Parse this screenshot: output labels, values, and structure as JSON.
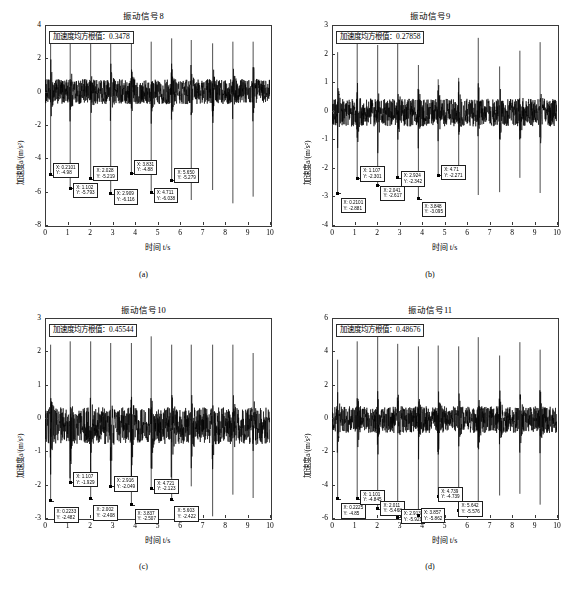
{
  "figure": {
    "axis_color": "#3a3a3a",
    "signal_color": "#000000",
    "xlabel": "时间 t/s",
    "ylabel": "加速度a/(m/s²)",
    "rms_prefix": "加速度均方根值："
  },
  "chart_data": [
    {
      "id": "panel-a",
      "type": "line",
      "title": "振动信号9",
      "title_actual": "振动信号8",
      "caption": "(a)",
      "xlabel": "时间 t/s",
      "ylabel": "加速度a/(m/s²)",
      "rms_label": "加速度均方根值：0.3478",
      "rms_value": "0.3478",
      "xlim": [
        0,
        10
      ],
      "ylim": [
        -8,
        4
      ],
      "xticks": [
        "0",
        "1",
        "2",
        "3",
        "4",
        "5",
        "6",
        "7",
        "8",
        "9",
        "10"
      ],
      "yticks": [
        "4",
        "2",
        "0",
        "-2",
        "-4",
        "-6",
        "-8"
      ],
      "grid": false,
      "noise_band": [
        -0.75,
        0.75
      ],
      "positive_spikes": [
        {
          "x": 0.25,
          "y": 3.3
        },
        {
          "x": 1.12,
          "y": 3.2
        },
        {
          "x": 2.03,
          "y": 3.1
        },
        {
          "x": 2.92,
          "y": 3.2
        },
        {
          "x": 3.84,
          "y": 3.1
        },
        {
          "x": 4.72,
          "y": 3.0
        },
        {
          "x": 5.63,
          "y": 3.2
        },
        {
          "x": 6.5,
          "y": 3.1
        },
        {
          "x": 7.45,
          "y": 2.9
        },
        {
          "x": 8.35,
          "y": 3.0
        },
        {
          "x": 9.25,
          "y": 3.0
        }
      ],
      "negative_spikes": [
        {
          "x": 0.25,
          "y": -4.98
        },
        {
          "x": 1.12,
          "y": -5.79
        },
        {
          "x": 2.03,
          "y": -5.23
        },
        {
          "x": 2.92,
          "y": -6.12
        },
        {
          "x": 3.84,
          "y": -4.88
        },
        {
          "x": 4.72,
          "y": -6.05
        },
        {
          "x": 5.63,
          "y": -5.3
        },
        {
          "x": 6.5,
          "y": -6.5
        },
        {
          "x": 7.45,
          "y": -5.9
        },
        {
          "x": 8.35,
          "y": -6.7
        },
        {
          "x": 9.25,
          "y": -6.3
        }
      ],
      "datatips": [
        {
          "x": "X: 0.2101",
          "y": "Y: -4.98",
          "px": 0.25,
          "py": -4.98,
          "bx": 0.35,
          "by": -4.25
        },
        {
          "x": "X: 1.102",
          "y": "Y: -5.793",
          "px": 1.12,
          "py": -5.79,
          "bx": 1.25,
          "by": -5.45
        },
        {
          "x": "X: 2.028",
          "y": "Y: -5.219",
          "px": 2.03,
          "py": -5.23,
          "bx": 2.15,
          "by": -4.45
        },
        {
          "x": "X: 2.909",
          "y": "Y: -6.116",
          "px": 2.92,
          "py": -6.12,
          "bx": 3.05,
          "by": -5.85
        },
        {
          "x": "X: 3.831",
          "y": "Y: -4.88",
          "px": 3.84,
          "py": -4.88,
          "bx": 3.95,
          "by": -4.08
        },
        {
          "x": "X: 4.711",
          "y": "Y: -6.038",
          "px": 4.72,
          "py": -6.05,
          "bx": 4.83,
          "by": -5.78
        },
        {
          "x": "X: 5.650",
          "y": "Y: -5.279",
          "px": 5.63,
          "py": -5.3,
          "bx": 5.75,
          "by": -4.55
        }
      ]
    },
    {
      "id": "panel-b",
      "type": "line",
      "title": "振动信号9",
      "caption": "(b)",
      "xlabel": "时间 t/s",
      "ylabel": "加速度a/(m/s²)",
      "rms_label": "加速度均方根值：0.27858",
      "rms_value": "0.27858",
      "xlim": [
        0,
        10
      ],
      "ylim": [
        -4,
        3
      ],
      "xticks": [
        "0",
        "1",
        "2",
        "3",
        "4",
        "5",
        "6",
        "7",
        "8",
        "9",
        "10"
      ],
      "yticks": [
        "3",
        "2",
        "1",
        "0",
        "-1",
        "-2",
        "-3",
        "-4"
      ],
      "grid": false,
      "noise_band": [
        -0.55,
        0.42
      ],
      "positive_spikes": [
        {
          "x": 0.25,
          "y": 2.05
        },
        {
          "x": 1.12,
          "y": 2.35
        },
        {
          "x": 2.03,
          "y": 2.3
        },
        {
          "x": 2.92,
          "y": 2.35
        },
        {
          "x": 3.84,
          "y": 1.6
        },
        {
          "x": 4.72,
          "y": 1.1
        },
        {
          "x": 5.63,
          "y": 1.15
        },
        {
          "x": 6.5,
          "y": 2.55
        },
        {
          "x": 7.45,
          "y": 1.55
        },
        {
          "x": 8.35,
          "y": 2.1
        },
        {
          "x": 9.25,
          "y": 2.4
        }
      ],
      "negative_spikes": [
        {
          "x": 0.25,
          "y": -2.88
        },
        {
          "x": 1.12,
          "y": -2.37
        },
        {
          "x": 2.03,
          "y": -2.6
        },
        {
          "x": 2.92,
          "y": -2.34
        },
        {
          "x": 3.84,
          "y": -3.08
        },
        {
          "x": 4.72,
          "y": -2.25
        },
        {
          "x": 5.63,
          "y": -2.18
        },
        {
          "x": 6.5,
          "y": -2.95
        },
        {
          "x": 7.45,
          "y": -2.85
        },
        {
          "x": 8.35,
          "y": -2.35
        },
        {
          "x": 9.25,
          "y": -2.88
        }
      ],
      "datatips": [
        {
          "x": "X: 0.2101",
          "y": "Y: -2.881",
          "px": 0.25,
          "py": -2.88,
          "bx": 0.38,
          "by": -3.05
        },
        {
          "x": "X: 1.107",
          "y": "Y: -2.301",
          "px": 1.12,
          "py": -2.37,
          "bx": 1.25,
          "by": -1.95
        },
        {
          "x": "X: 2.041",
          "y": "Y: -2.617",
          "px": 2.03,
          "py": -2.6,
          "bx": 2.15,
          "by": -2.62
        },
        {
          "x": "X: 2.924",
          "y": "Y: -2.342",
          "px": 2.92,
          "py": -2.34,
          "bx": 3.05,
          "by": -2.12
        },
        {
          "x": "X: 3.848",
          "y": "Y: -3.095",
          "px": 3.84,
          "py": -3.08,
          "bx": 3.98,
          "by": -3.18
        },
        {
          "x": "X: 4.71",
          "y": "Y: -2.271",
          "px": 4.72,
          "py": -2.25,
          "bx": 4.85,
          "by": -1.9
        }
      ]
    },
    {
      "id": "panel-c",
      "type": "line",
      "title": "振动信号10",
      "caption": "(c)",
      "xlabel": "时间 t/s",
      "ylabel": "加速度a/(m/s²)",
      "rms_label": "加速度均方根值：0.45544",
      "rms_value": "0.45544",
      "xlim": [
        0,
        10
      ],
      "ylim": [
        -3,
        3
      ],
      "xticks": [
        "0",
        "1",
        "2",
        "3",
        "4",
        "5",
        "6",
        "7",
        "8",
        "9",
        "10"
      ],
      "yticks": [
        "3",
        "2",
        "1",
        "0",
        "-1",
        "-2",
        "-3"
      ],
      "grid": false,
      "noise_band": [
        -0.78,
        0.32
      ],
      "positive_spikes": [
        {
          "x": 0.25,
          "y": 2.2
        },
        {
          "x": 1.12,
          "y": 2.3
        },
        {
          "x": 2.03,
          "y": 2.3
        },
        {
          "x": 2.92,
          "y": 2.25
        },
        {
          "x": 3.84,
          "y": 2.25
        },
        {
          "x": 4.72,
          "y": 2.45
        },
        {
          "x": 5.63,
          "y": 2.2
        },
        {
          "x": 6.5,
          "y": 2.2
        },
        {
          "x": 7.45,
          "y": 2.2
        },
        {
          "x": 8.35,
          "y": 2.2
        },
        {
          "x": 9.25,
          "y": 1.95
        }
      ],
      "negative_spikes": [
        {
          "x": 0.25,
          "y": -2.48
        },
        {
          "x": 1.12,
          "y": -1.93
        },
        {
          "x": 2.03,
          "y": -2.42
        },
        {
          "x": 2.92,
          "y": -2.05
        },
        {
          "x": 3.84,
          "y": -2.6
        },
        {
          "x": 4.72,
          "y": -2.12
        },
        {
          "x": 5.63,
          "y": -2.45
        },
        {
          "x": 6.5,
          "y": -2.05
        },
        {
          "x": 7.45,
          "y": -2.95
        },
        {
          "x": 8.35,
          "y": -2.3
        },
        {
          "x": 9.25,
          "y": -2.4
        }
      ],
      "datatips": [
        {
          "x": "X: 0.2233",
          "y": "Y: -2.482",
          "px": 0.25,
          "py": -2.48,
          "bx": 0.38,
          "by": -2.68
        },
        {
          "x": "X: 1.107",
          "y": "Y: -1.929",
          "px": 1.12,
          "py": -1.93,
          "bx": 1.25,
          "by": -1.62
        },
        {
          "x": "X: 2.002",
          "y": "Y: -2.408",
          "px": 2.03,
          "py": -2.42,
          "bx": 2.15,
          "by": -2.62
        },
        {
          "x": "X: 2.916",
          "y": "Y: -2.049",
          "px": 2.92,
          "py": -2.05,
          "bx": 3.05,
          "by": -1.75
        },
        {
          "x": "X: 3.837",
          "y": "Y: -2.507",
          "px": 3.84,
          "py": -2.6,
          "bx": 3.98,
          "by": -2.72
        },
        {
          "x": "X: 4.721",
          "y": "Y: -2.123",
          "px": 4.72,
          "py": -2.12,
          "bx": 4.85,
          "by": -1.82
        },
        {
          "x": "X: 5.603",
          "y": "Y: -2.422",
          "px": 5.63,
          "py": -2.45,
          "bx": 5.75,
          "by": -2.65
        }
      ]
    },
    {
      "id": "panel-d",
      "type": "line",
      "title": "振动信号11",
      "caption": "(d)",
      "xlabel": "时间 t/s",
      "ylabel": "加速度a/(m/s²)",
      "rms_label": "加速度均方根值：0.48676",
      "rms_value": "0.48676",
      "xlim": [
        0,
        10
      ],
      "ylim": [
        -6,
        6
      ],
      "xticks": [
        "0",
        "1",
        "2",
        "3",
        "4",
        "5",
        "6",
        "7",
        "8",
        "9",
        "10"
      ],
      "yticks": [
        "6",
        "4",
        "2",
        "0",
        "-2",
        "-4",
        "-6"
      ],
      "grid": false,
      "noise_band": [
        -0.9,
        0.7
      ],
      "positive_spikes": [
        {
          "x": 0.25,
          "y": 3.5
        },
        {
          "x": 1.12,
          "y": 4.6
        },
        {
          "x": 2.03,
          "y": 5.2
        },
        {
          "x": 2.92,
          "y": 4.45
        },
        {
          "x": 3.84,
          "y": 4.3
        },
        {
          "x": 4.72,
          "y": 4.35
        },
        {
          "x": 5.63,
          "y": 4.3
        },
        {
          "x": 6.5,
          "y": 4.85
        },
        {
          "x": 7.45,
          "y": 3.75
        },
        {
          "x": 8.35,
          "y": 4.55
        },
        {
          "x": 9.25,
          "y": 4.1
        }
      ],
      "negative_spikes": [
        {
          "x": 0.25,
          "y": -4.85
        },
        {
          "x": 1.12,
          "y": -4.85
        },
        {
          "x": 2.03,
          "y": -5.45
        },
        {
          "x": 2.92,
          "y": -5.95
        },
        {
          "x": 3.84,
          "y": -5.85
        },
        {
          "x": 4.72,
          "y": -4.7
        },
        {
          "x": 5.63,
          "y": -5.55
        },
        {
          "x": 6.5,
          "y": -5.4
        },
        {
          "x": 7.45,
          "y": -4.65
        },
        {
          "x": 8.35,
          "y": -4.55
        },
        {
          "x": 9.25,
          "y": -5.2
        }
      ],
      "datatips": [
        {
          "x": "X: 0.2225",
          "y": "Y: -4.85",
          "px": 0.25,
          "py": -4.85,
          "bx": 0.38,
          "by": -5.12
        },
        {
          "x": "X: 1.101",
          "y": "Y: -4.845",
          "px": 1.12,
          "py": -4.85,
          "bx": 1.25,
          "by": -4.3
        },
        {
          "x": "X: 2.011",
          "y": "Y: -5.468",
          "px": 2.03,
          "py": -5.45,
          "bx": 2.15,
          "by": -4.95
        },
        {
          "x": "X: 2.913",
          "y": "Y: -5.921",
          "px": 2.92,
          "py": -5.95,
          "bx": 3.05,
          "by": -5.45
        },
        {
          "x": "X: 3.857",
          "y": "Y: -5.862",
          "px": 3.84,
          "py": -5.85,
          "bx": 3.95,
          "by": -5.4
        },
        {
          "x": "X: 4.739",
          "y": "Y: -4.739",
          "px": 4.72,
          "py": -4.7,
          "bx": 4.72,
          "by": -4.12
        },
        {
          "x": "X: 5.642",
          "y": "Y: -5.576",
          "px": 5.63,
          "py": -5.55,
          "bx": 5.62,
          "by": -5.0
        }
      ]
    }
  ]
}
